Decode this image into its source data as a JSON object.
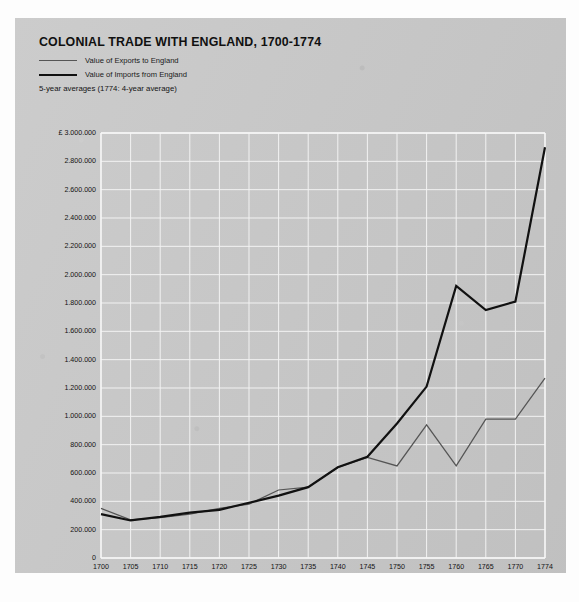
{
  "header": {
    "title": "COLONIAL TRADE WITH ENGLAND, 1700-1774",
    "subnote": "5-year averages (1774: 4-year average)"
  },
  "legend": {
    "items": [
      {
        "label": "Value of Exports to England",
        "color": "#555555",
        "style": "thin-gray"
      },
      {
        "label": "Value of Imports from England",
        "color": "#111111",
        "style": "thick-black"
      }
    ]
  },
  "chart_data": {
    "type": "line",
    "title": "COLONIAL TRADE WITH ENGLAND, 1700-1774",
    "subtitle": "5-year averages (1774: 4-year average)",
    "xlabel": "",
    "ylabel": "",
    "x": [
      1700,
      1705,
      1710,
      1715,
      1720,
      1725,
      1730,
      1735,
      1740,
      1745,
      1750,
      1755,
      1760,
      1765,
      1770,
      1774
    ],
    "categories": [
      "1700",
      "1705",
      "1710",
      "1715",
      "1720",
      "1725",
      "1730",
      "1735",
      "1740",
      "1745",
      "1750",
      "1755",
      "1760",
      "1765",
      "1770",
      "1774"
    ],
    "series": [
      {
        "name": "Value of Exports to England",
        "color": "#555555",
        "values": [
          350000,
          270000,
          285000,
          310000,
          350000,
          380000,
          480000,
          500000,
          640000,
          710000,
          650000,
          940000,
          650000,
          980000,
          980000,
          1270000
        ]
      },
      {
        "name": "Value of Imports from England",
        "color": "#111111",
        "values": [
          310000,
          265000,
          290000,
          320000,
          340000,
          390000,
          440000,
          500000,
          640000,
          715000,
          950000,
          1210000,
          1920000,
          1750000,
          1810000,
          2900000
        ]
      }
    ],
    "ylim": [
      0,
      3000000
    ],
    "xlim": [
      1700,
      1774
    ],
    "ytick_labels": [
      "£ 3.000.000",
      "2.800.000",
      "2.600.000",
      "2.400.000",
      "2.200.000",
      "2.000.000",
      "1.800.000",
      "1.600.000",
      "1.400.000",
      "1.200.000",
      "1.000.000",
      "800.000",
      "600.000",
      "400.000",
      "200.000",
      "0"
    ],
    "ytick_values": [
      3000000,
      2800000,
      2600000,
      2400000,
      2200000,
      2000000,
      1800000,
      1600000,
      1400000,
      1200000,
      1000000,
      800000,
      600000,
      400000,
      200000,
      0
    ],
    "grid": true,
    "grid_color": "#f2f2f2",
    "legend_position": "top-left",
    "currency_symbol": "£"
  }
}
